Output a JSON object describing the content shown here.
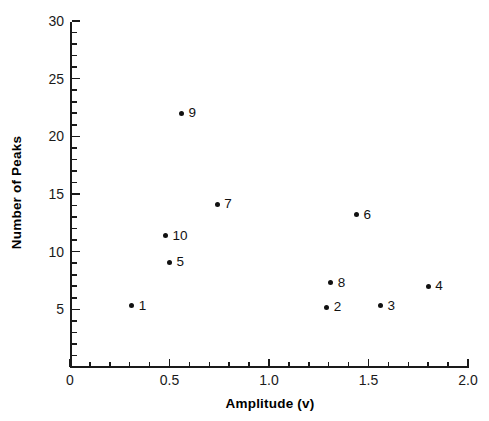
{
  "chart_data": {
    "type": "scatter",
    "title": "",
    "xlabel": "Amplitude (v)",
    "ylabel": "Number of Peaks",
    "xlim": [
      0,
      2.0
    ],
    "ylim": [
      0,
      30
    ],
    "x_major_ticks": [
      0,
      0.5,
      1.0,
      1.5,
      2.0
    ],
    "x_tick_labels": [
      "0",
      "0.5",
      "1.0",
      "1.5",
      "2.0"
    ],
    "x_minor_step": 0.1,
    "y_major_ticks": [
      0,
      5,
      10,
      15,
      20,
      25,
      30
    ],
    "y_tick_labels": [
      "0",
      "5",
      "10",
      "15",
      "20",
      "25",
      "30"
    ],
    "y_minor_step": 1,
    "grid": false,
    "legend": "none",
    "marker": "filled-circle",
    "marker_color": "#111111",
    "points": [
      {
        "label": "1",
        "x": 0.31,
        "y": 5.3
      },
      {
        "label": "2",
        "x": 1.29,
        "y": 5.2
      },
      {
        "label": "3",
        "x": 1.56,
        "y": 5.3
      },
      {
        "label": "4",
        "x": 1.8,
        "y": 7.0
      },
      {
        "label": "5",
        "x": 0.5,
        "y": 9.1
      },
      {
        "label": "6",
        "x": 1.44,
        "y": 13.2
      },
      {
        "label": "7",
        "x": 0.74,
        "y": 14.1
      },
      {
        "label": "8",
        "x": 1.31,
        "y": 7.3
      },
      {
        "label": "9",
        "x": 0.56,
        "y": 22.0
      },
      {
        "label": "10",
        "x": 0.48,
        "y": 11.4
      }
    ]
  },
  "axes": {
    "x_title": "Amplitude (v)",
    "y_title": "Number of Peaks"
  }
}
